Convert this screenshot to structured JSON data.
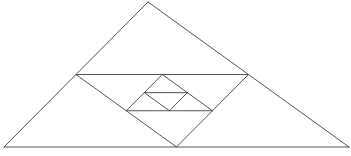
{
  "diagram": {
    "colors": {
      "background": "#ffffff",
      "stroke": "#555555"
    },
    "points": {
      "A": "apex",
      "B": "bottom-left",
      "C": "bottom-right",
      "D": "midpoint AB",
      "E": "midpoint AC",
      "F": "midpoint BC",
      "G": "midpoint DE",
      "H": "midpoint DF",
      "I": "midpoint EF",
      "J": "midpoint GH",
      "K": "midpoint GI",
      "L": "midpoint HI"
    },
    "segments": [
      {
        "id": "outer-ab",
        "from": "A",
        "to": "B",
        "level": 0
      },
      {
        "id": "outer-ac",
        "from": "A",
        "to": "C",
        "level": 0
      },
      {
        "id": "outer-bc",
        "from": "B",
        "to": "C",
        "level": 0
      },
      {
        "id": "mid-de",
        "from": "D",
        "to": "E",
        "level": 1
      },
      {
        "id": "mid-df",
        "from": "D",
        "to": "F",
        "level": 1
      },
      {
        "id": "mid-ef",
        "from": "E",
        "to": "F",
        "level": 1
      },
      {
        "id": "inner-gh",
        "from": "G",
        "to": "H",
        "level": 2
      },
      {
        "id": "inner-gi",
        "from": "G",
        "to": "I",
        "level": 2
      },
      {
        "id": "inner-hi",
        "from": "H",
        "to": "I",
        "level": 2
      },
      {
        "id": "small-jk",
        "from": "J",
        "to": "K",
        "level": 3
      },
      {
        "id": "small-jl",
        "from": "J",
        "to": "L",
        "level": 3
      },
      {
        "id": "small-kl",
        "from": "K",
        "to": "L",
        "level": 3
      }
    ]
  }
}
